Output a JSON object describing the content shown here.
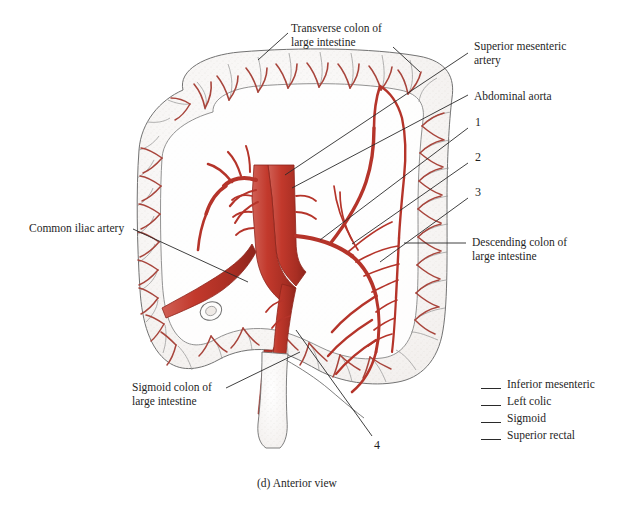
{
  "figure": {
    "caption": "(d) Anterior view",
    "view": "Anterior view",
    "background_color": "#ffffff",
    "artery_color": "#b5342a",
    "artery_color_light": "#a8453c",
    "outline_color": "#4a4a4a",
    "leader_color": "#2a2a2a"
  },
  "labels": [
    {
      "id": "transverse-colon",
      "text": "Transverse colon of\nlarge intestine"
    },
    {
      "id": "superior-mesenteric-artery",
      "text": "Superior mesenteric\nartery"
    },
    {
      "id": "abdominal-aorta",
      "text": "Abdominal aorta"
    },
    {
      "id": "common-iliac-artery",
      "text": "Common iliac artery"
    },
    {
      "id": "descending-colon",
      "text": "Descending colon of\nlarge intestine"
    },
    {
      "id": "sigmoid-colon",
      "text": "Sigmoid colon of\nlarge intestine"
    }
  ],
  "callouts": [
    {
      "number": "1"
    },
    {
      "number": "2"
    },
    {
      "number": "3"
    },
    {
      "number": "4"
    }
  ],
  "legend": {
    "items": [
      {
        "label": "Inferior mesenteric"
      },
      {
        "label": "Left colic"
      },
      {
        "label": "Sigmoid"
      },
      {
        "label": "Superior rectal"
      }
    ]
  }
}
